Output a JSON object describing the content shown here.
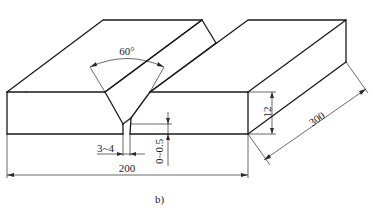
{
  "figure": {
    "caption": "b)"
  },
  "dimensions": {
    "groove_angle": "60°",
    "root_gap": "3~4",
    "root_face": "0~0.5",
    "width": "200",
    "thickness": "12",
    "length": "300"
  },
  "colors": {
    "line": "#1a1a1a",
    "background": "#ffffff"
  }
}
